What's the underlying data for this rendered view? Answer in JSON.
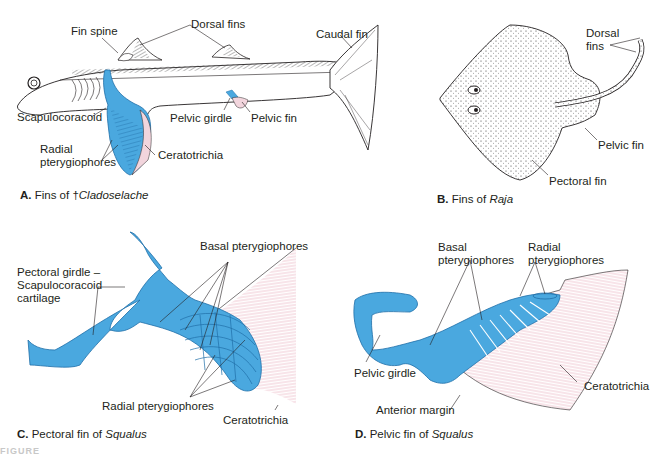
{
  "colors": {
    "cartilage_blue": "#4aa8df",
    "cartilage_blue_dark": "#1f6ea8",
    "ceratotrichia_pink": "#e6a3b5",
    "ink": "#231f20"
  },
  "panelA": {
    "caption_letter": "A.",
    "caption_prefix": "Fins of †",
    "caption_taxon": "Cladoselache",
    "labels": {
      "fin_spine": "Fin spine",
      "dorsal_fins": "Dorsal fins",
      "caudal_fin": "Caudal fin",
      "scapulocoracoid": "Scapulocoracoid",
      "pelvic_girdle": "Pelvic girdle",
      "pelvic_fin": "Pelvic fin",
      "radial_pterygiophores_1": "Radial",
      "radial_pterygiophores_2": "pterygiophores",
      "ceratotrichia": "Ceratotrichia"
    }
  },
  "panelB": {
    "caption_letter": "B.",
    "caption_prefix": "Fins of ",
    "caption_taxon": "Raja",
    "labels": {
      "dorsal_fins_1": "Dorsal",
      "dorsal_fins_2": "fins",
      "pelvic_fin": "Pelvic fin",
      "pectoral_fin": "Pectoral fin"
    }
  },
  "panelC": {
    "caption_letter": "C.",
    "caption_prefix": "Pectoral fin of ",
    "caption_taxon": "Squalus",
    "labels": {
      "basal_pterygiophores": "Basal pterygiophores",
      "pectoral_girdle_1": "Pectoral girdle –",
      "pectoral_girdle_2": "Scapulocoracoid",
      "pectoral_girdle_3": "cartilage",
      "radial_pterygiophores": "Radial pterygiophores",
      "ceratotrichia": "Ceratotrichia"
    }
  },
  "panelD": {
    "caption_letter": "D.",
    "caption_prefix": "Pelvic fin of ",
    "caption_taxon": "Squalus",
    "labels": {
      "basal_1": "Basal",
      "basal_2": "pterygiophores",
      "radial_1": "Radial",
      "radial_2": "pterygiophores",
      "pelvic_girdle": "Pelvic girdle",
      "anterior_margin": "Anterior margin",
      "ceratotrichia": "Ceratotrichia"
    }
  },
  "figure_label": "FIGURE"
}
